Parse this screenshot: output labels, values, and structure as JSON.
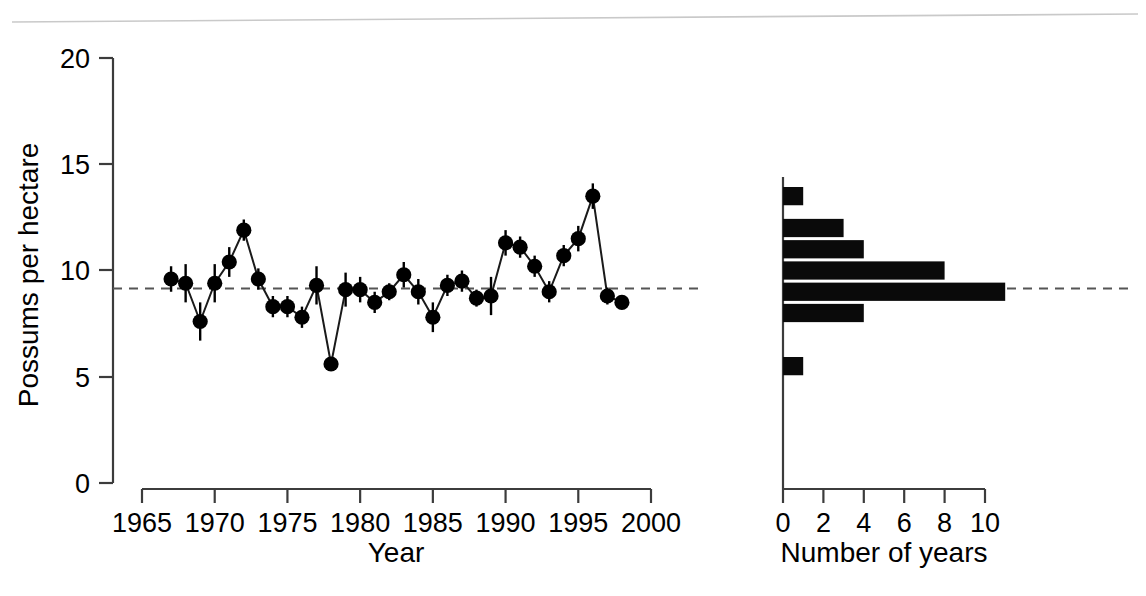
{
  "chart_data": {
    "type": "scatter",
    "title": "",
    "panels": [
      {
        "name": "time-series",
        "type": "scatter",
        "xlabel": "Year",
        "ylabel": "Possums per hectare",
        "xlim": [
          1963.5,
          2001.5
        ],
        "ylim": [
          0,
          20
        ],
        "xticks": [
          1965,
          1970,
          1975,
          1980,
          1985,
          1990,
          1995,
          2000
        ],
        "xtick_labels": [
          "1965",
          "1970",
          "1975",
          "1980",
          "1985",
          "1990",
          "1995",
          "2000"
        ],
        "yticks": [
          0,
          5,
          10,
          15,
          20
        ],
        "ytick_labels": [
          "0",
          "5",
          "10",
          "15",
          "20"
        ],
        "grid": false,
        "legend": "none",
        "reference_line": {
          "value": 9.15,
          "style": "dashed",
          "label": "mean density"
        },
        "x": [
          1967,
          1968,
          1969,
          1970,
          1971,
          1972,
          1973,
          1974,
          1975,
          1976,
          1977,
          1978,
          1979,
          1980,
          1981,
          1982,
          1983,
          1984,
          1985,
          1986,
          1987,
          1988,
          1989,
          1990,
          1991,
          1992,
          1993,
          1994,
          1995,
          1996,
          1997,
          1998
        ],
        "values": [
          9.6,
          9.4,
          7.6,
          9.4,
          10.4,
          11.9,
          9.6,
          8.3,
          8.3,
          7.8,
          9.3,
          5.6,
          9.1,
          9.1,
          8.5,
          9.0,
          9.8,
          9.0,
          7.8,
          9.3,
          9.5,
          8.7,
          8.8,
          11.3,
          11.1,
          10.2,
          9.0,
          10.7,
          11.5,
          13.5,
          8.8,
          8.5
        ],
        "errors": [
          0.6,
          0.9,
          0.9,
          0.9,
          0.7,
          0.5,
          0.5,
          0.5,
          0.5,
          0.5,
          0.9,
          0.3,
          0.8,
          0.6,
          0.5,
          0.4,
          0.6,
          0.6,
          0.7,
          0.5,
          0.5,
          0.4,
          0.9,
          0.6,
          0.5,
          0.5,
          0.5,
          0.5,
          0.6,
          0.6,
          0.4,
          0.3
        ],
        "error_type": "standard error bars",
        "marker": "filled-circle",
        "line": "solid connecting line"
      },
      {
        "name": "histogram",
        "type": "bar",
        "orientation": "horizontal",
        "xlabel": "Number of years",
        "ylabel": "",
        "xlim": [
          0,
          11.2
        ],
        "ylim": [
          0,
          20
        ],
        "xticks": [
          0,
          2,
          4,
          6,
          8,
          10
        ],
        "xtick_labels": [
          "0",
          "2",
          "4",
          "6",
          "8",
          "10"
        ],
        "grid": false,
        "legend": "none",
        "bin_centers": [
          13.5,
          12.0,
          11.0,
          10.0,
          9.0,
          8.0,
          5.5
        ],
        "bin_low": [
          13.0,
          11.5,
          10.5,
          9.5,
          8.5,
          7.5,
          5.0
        ],
        "bin_high": [
          14.0,
          12.5,
          11.5,
          10.5,
          9.5,
          8.5,
          6.0
        ],
        "values": [
          1,
          3,
          4,
          8,
          11,
          4,
          1
        ],
        "reference_line": {
          "value": 9.15,
          "style": "dashed"
        }
      }
    ]
  },
  "axes": {
    "left_panel": {
      "y_title": "Possums per hectare",
      "x_title": "Year"
    },
    "right_panel": {
      "x_title": "Number of years"
    }
  },
  "colors": {
    "marker": "#000000",
    "line": "#1a1a1a",
    "bar": "#0a0a0a",
    "axis": "#3c3c3c",
    "reference": "#555555",
    "background": "#ffffff"
  }
}
